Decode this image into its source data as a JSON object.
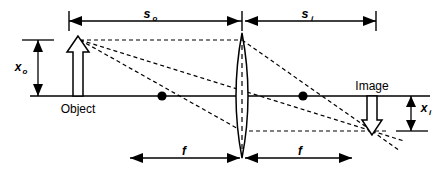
{
  "diagram": {
    "type": "optics-ray-diagram",
    "colors": {
      "stroke": "#000000",
      "background": "#ffffff",
      "fill_hollow": "#ffffff"
    },
    "labels": {
      "object": "Object",
      "image": "Image",
      "object_distance": "s",
      "object_distance_sub": "o",
      "image_distance": "s",
      "image_distance_sub": "i",
      "object_height": "x",
      "object_height_sub": "o",
      "image_height": "x",
      "image_height_sub": "i",
      "focal_left": "f",
      "focal_right": "f"
    },
    "geometry": {
      "axis_y": 96,
      "axis_x_start": 30,
      "axis_x_end": 430,
      "lens_center_x": 242,
      "lens_top_y": 33,
      "lens_bottom_y": 158,
      "lens_half_width": 10,
      "object_base_x": 78,
      "object_tip_y": 40,
      "image_base_x": 372,
      "image_tip_y": 131,
      "focal_left_x": 162,
      "focal_right_x": 303,
      "dim_top_y": 21,
      "dim_left_x": 69,
      "dim_right_x": 376,
      "dim_bottom_y": 158,
      "f_left_x": 165,
      "f_right_x": 318,
      "xo_dim_x": 38,
      "xo_top_y": 40,
      "xo_bottom_y": 96,
      "xi_dim_x": 411,
      "xi_top_y": 96,
      "xi_bottom_y": 131
    },
    "elements": {
      "optical_axis": "optical-axis",
      "lens": "converging-lens",
      "object_arrow": "object-arrow-up",
      "image_arrow": "image-arrow-down",
      "focal_point_left": "focal-point-left",
      "focal_point_right": "focal-point-right",
      "ray_parallel": "ray-parallel-to-axis",
      "ray_center": "ray-through-center",
      "ray_focal": "ray-through-focal-point"
    }
  }
}
